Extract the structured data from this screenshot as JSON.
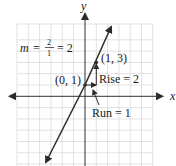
{
  "diagram": {
    "axes": {
      "x_label": "x",
      "y_label": "y"
    },
    "slope_formula": {
      "variable": "m",
      "equals": "=",
      "numerator": "2",
      "denominator": "1",
      "result": "= 2"
    },
    "points": [
      {
        "label": "(0, 1)",
        "x": 0,
        "y": 1
      },
      {
        "label": "(1, 3)",
        "x": 1,
        "y": 3
      }
    ],
    "annotations": {
      "rise": "Rise = 2",
      "run": "Run = 1"
    },
    "line": {
      "slope": 2,
      "intercept": 1
    },
    "colors": {
      "grid": "#d9d9d9",
      "axis": "#333333",
      "line": "#2b2b2b",
      "text": "#1a1a1a"
    }
  }
}
